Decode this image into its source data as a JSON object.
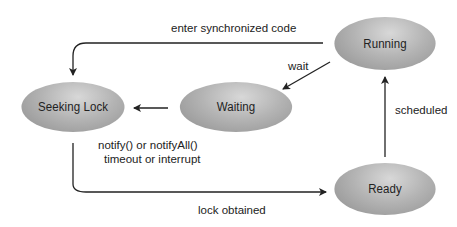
{
  "diagram": {
    "type": "state-diagram",
    "nodes": {
      "seeking_lock": "Seeking Lock",
      "waiting": "Waiting",
      "running": "Running",
      "ready": "Ready"
    },
    "edges": {
      "running_to_seeking": "enter synchronized code",
      "running_to_waiting": "wait",
      "waiting_to_seeking_line1": "notify() or notifyAll()",
      "waiting_to_seeking_line2": "timeout or interrupt",
      "seeking_to_ready": "lock obtained",
      "ready_to_running": "scheduled"
    },
    "colors": {
      "node_fill": "#b0b0b0",
      "arrow": "#222222",
      "text": "#222222"
    }
  }
}
